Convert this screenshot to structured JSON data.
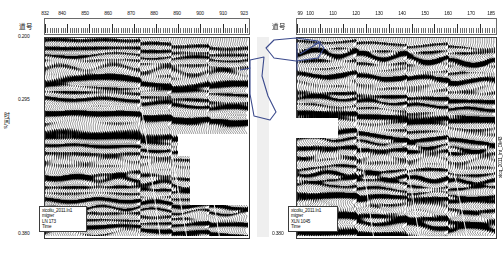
{
  "figure": {
    "width": 499,
    "height": 256,
    "background": "#ffffff",
    "caption": ""
  },
  "axis": {
    "trace_label": "道号",
    "time_label": "时间/s",
    "time_ticks": [
      "0.200",
      "0.295",
      "0.380"
    ],
    "time_range": [
      0.2,
      0.38
    ],
    "grid": false
  },
  "panels": [
    {
      "id": "left",
      "name": "inline-panel",
      "trace_label": "道号",
      "trace_ticks": [
        "832",
        "840",
        "850",
        "860",
        "870",
        "880",
        "890",
        "900",
        "910",
        "923"
      ],
      "trace_values": [
        832,
        840,
        850,
        860,
        870,
        880,
        890,
        900,
        910,
        923
      ],
      "trace_range": [
        832,
        923
      ],
      "info": {
        "line1": "xicoliu_2011.ln1",
        "line2": "migrer",
        "line3": "LN 173",
        "line4": "Time"
      }
    },
    {
      "id": "right",
      "name": "crossline-panel",
      "trace_label": "道号",
      "trace_ticks": [
        "99",
        "100",
        "110",
        "120",
        "130",
        "140",
        "150",
        "160",
        "170",
        "185"
      ],
      "trace_values": [
        99,
        100,
        110,
        120,
        130,
        140,
        150,
        160,
        170,
        185
      ],
      "trace_range": [
        99,
        185
      ],
      "info": {
        "line1": "xicoliu_2011.ln1",
        "line2": "migrer",
        "line3": "XLN 1045",
        "line4": "Time"
      }
    }
  ],
  "corner_label": "xicq_2011_lnt_Dk43",
  "annotation": {
    "name": "hand-drawn-fault-sketch",
    "color": "#3b4a8c",
    "description": "hand drawn polygon and arrow annotation over gutter"
  },
  "colors": {
    "trace_fill": "#000000",
    "background": "#ffffff",
    "frame": "#3a3a3a",
    "annotation": "#3b4a8c"
  },
  "chart_data": {
    "type": "line",
    "title": "",
    "xlabel": "道号",
    "ylabel": "时间/s",
    "ylim": [
      0.2,
      0.38
    ],
    "series": [
      {
        "name": "LN 173 seismic wiggle section",
        "xlim": [
          832,
          923
        ],
        "n_traces": 92
      },
      {
        "name": "XLN 1045 seismic wiggle section",
        "xlim": [
          99,
          185
        ],
        "n_traces": 87
      }
    ]
  }
}
